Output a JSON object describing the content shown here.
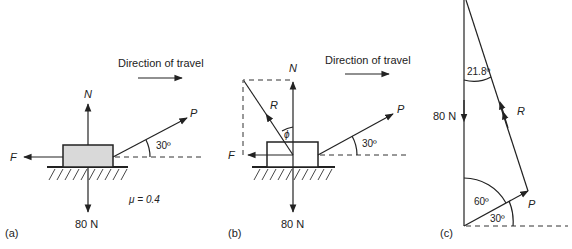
{
  "panels": {
    "a": {
      "tag": "(a)",
      "direction_label": "Direction of travel",
      "normal_label": "N",
      "push_label": "P",
      "friction_label": "F",
      "angle_label": "30º",
      "weight_label": "80 N",
      "mu_label": "μ = 0.4"
    },
    "b": {
      "tag": "(b)",
      "direction_label": "Direction of travel",
      "normal_label": "N",
      "push_label": "P",
      "friction_label": "F",
      "resultant_label": "R",
      "phi_label": "ϕ",
      "angle_label": "30º",
      "weight_label": "80 N"
    },
    "c": {
      "tag": "(c)",
      "weight_label": "80 N",
      "resultant_label": "R",
      "push_label": "P",
      "top_angle_label": "21.8º",
      "bottom_angle_label": "60º",
      "base_angle_label": "30º"
    }
  },
  "colors": {
    "line": "#222222",
    "block_fill": "#d9d9d9",
    "block_fill_b": "#ffffff"
  }
}
